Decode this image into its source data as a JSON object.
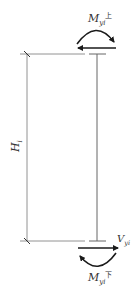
{
  "diagram": {
    "type": "column free-body diagram",
    "height_label": {
      "main": "H",
      "sub": "i"
    },
    "top_moment_label": {
      "main": "M",
      "sub": "yi",
      "sup": "上"
    },
    "bottom_moment_label": {
      "main": "M",
      "sub": "yi",
      "sup": "下"
    },
    "shear_label": {
      "main": "V",
      "sub": "yi"
    },
    "colors": {
      "line": "#555555",
      "arrow": "#1a1a1a",
      "text": "#333333"
    }
  }
}
